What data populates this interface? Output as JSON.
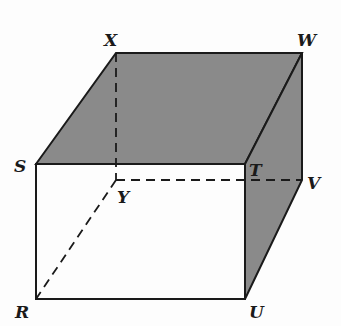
{
  "diagram": {
    "type": "rectangular-prism",
    "colors": {
      "shade": "#8a8a8a",
      "edge": "#1a1a1a",
      "background": "#fdfdfd"
    },
    "vertices": {
      "X": {
        "label": "X",
        "x": 116,
        "y": 53
      },
      "W": {
        "label": "W",
        "x": 302,
        "y": 53
      },
      "S": {
        "label": "S",
        "x": 36,
        "y": 164
      },
      "T": {
        "label": "T",
        "x": 245,
        "y": 164
      },
      "Y": {
        "label": "Y",
        "x": 116,
        "y": 180
      },
      "V": {
        "label": "V",
        "x": 302,
        "y": 180
      },
      "R": {
        "label": "R",
        "x": 36,
        "y": 299
      },
      "U": {
        "label": "U",
        "x": 245,
        "y": 299
      }
    },
    "shaded_faces": [
      "SXWT",
      "TWVU"
    ],
    "hidden_edges": [
      "XY",
      "YV",
      "YR"
    ]
  }
}
